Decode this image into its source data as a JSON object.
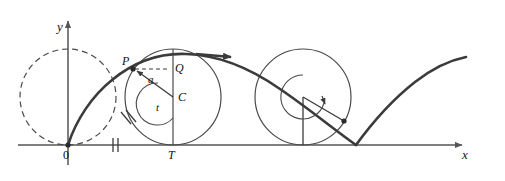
{
  "figure": {
    "kind": "cycloid-diagram",
    "colors": {
      "curve": "#3b3b3b",
      "circle": "#4a4a4a",
      "axis": "#555555",
      "dashed": "#4a4a4a",
      "label": "#111111"
    }
  },
  "axes": {
    "x_label": "x",
    "y_label": "y",
    "origin_label": "0",
    "x_axis_y": 145,
    "y_axis_x": 68
  },
  "labels": {
    "point_p": "P",
    "point_q": "Q",
    "center_c": "C",
    "radius_a": "a",
    "angle_t": "t",
    "tangent_t": "T",
    "origin": "0",
    "axis_x": "x",
    "axis_y": "y"
  },
  "geometry": {
    "radius": 48,
    "circles": [
      {
        "name": "initial-circle",
        "cx": 68,
        "cy": 97,
        "r": 48,
        "style": "dashed"
      },
      {
        "name": "generating-circle",
        "cx": 173,
        "cy": 97,
        "r": 48,
        "style": "solid"
      },
      {
        "name": "second-circle",
        "cx": 303,
        "cy": 97,
        "r": 48,
        "style": "solid"
      }
    ],
    "point_p": {
      "x": 133,
      "y": 69
    },
    "point_q": {
      "x": 173,
      "y": 69
    },
    "center_c": {
      "x": 173,
      "y": 97
    },
    "point_t": {
      "x": 173,
      "y": 145
    },
    "contact_point_2": {
      "x": 341,
      "y": 120
    },
    "cusp": {
      "x": 356,
      "y": 145
    },
    "curve_end": {
      "x": 466,
      "y": 58
    },
    "angle_t_degrees": 215,
    "inner_arc_radius": 20,
    "inner_arc_radius_2": 22
  },
  "marks": {
    "arc_tick": {
      "count": 2,
      "meaning": "arc PT length"
    },
    "axis_tick": {
      "count": 2,
      "meaning": "segment length equal to arc"
    },
    "direction_arrow": {
      "meaning": "direction of motion along the cycloid"
    }
  }
}
